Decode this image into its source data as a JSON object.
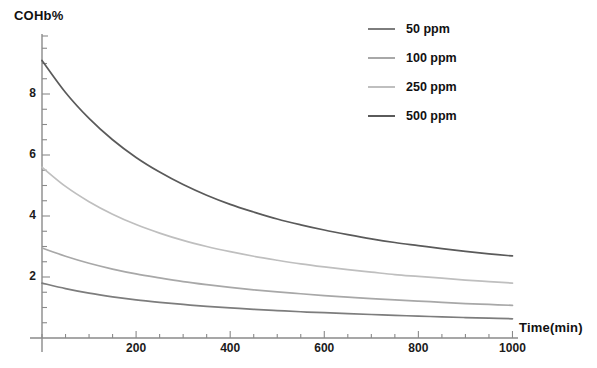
{
  "chart_data": {
    "type": "line",
    "title": "",
    "xlabel": "Time(min)",
    "ylabel": "COHb%",
    "xlim": [
      0,
      1050
    ],
    "ylim": [
      0,
      9.6
    ],
    "grid": false,
    "legend_position": "top-right",
    "xticks": [
      200,
      400,
      600,
      800,
      1000
    ],
    "xtick_labels": [
      "200",
      "400",
      "600",
      "800",
      "1000"
    ],
    "xminor_step": 50,
    "yticks": [
      2,
      4,
      6,
      8
    ],
    "ytick_labels": [
      "2",
      "4",
      "6",
      "8"
    ],
    "yminor_step": 0.5,
    "x": [
      0,
      50,
      100,
      150,
      200,
      250,
      300,
      350,
      400,
      450,
      500,
      550,
      600,
      650,
      700,
      750,
      800,
      850,
      900,
      950,
      1000
    ],
    "series": [
      {
        "name": "50 ppm",
        "color": "#7d7d7d",
        "values": [
          1.8,
          1.62,
          1.47,
          1.35,
          1.25,
          1.17,
          1.1,
          1.04,
          0.99,
          0.94,
          0.9,
          0.86,
          0.83,
          0.8,
          0.77,
          0.74,
          0.72,
          0.69,
          0.67,
          0.65,
          0.63
        ]
      },
      {
        "name": "100 ppm",
        "color": "#a8a8a8",
        "values": [
          2.95,
          2.68,
          2.45,
          2.26,
          2.1,
          1.97,
          1.85,
          1.75,
          1.66,
          1.58,
          1.51,
          1.45,
          1.39,
          1.34,
          1.29,
          1.25,
          1.21,
          1.17,
          1.13,
          1.1,
          1.07
        ]
      },
      {
        "name": "250 ppm",
        "color": "#bfbfbf",
        "values": [
          5.6,
          4.97,
          4.47,
          4.06,
          3.72,
          3.44,
          3.2,
          3.0,
          2.83,
          2.68,
          2.55,
          2.43,
          2.33,
          2.24,
          2.16,
          2.08,
          2.02,
          1.96,
          1.9,
          1.85,
          1.8
        ]
      },
      {
        "name": "500 ppm",
        "color": "#5a5a5a",
        "values": [
          9.1,
          8.05,
          7.2,
          6.5,
          5.92,
          5.44,
          5.03,
          4.68,
          4.38,
          4.13,
          3.9,
          3.71,
          3.54,
          3.39,
          3.25,
          3.13,
          3.03,
          2.93,
          2.84,
          2.76,
          2.69
        ]
      }
    ],
    "axis_color": "#8a8a8a"
  },
  "legend": {
    "items": [
      {
        "label": "50 ppm"
      },
      {
        "label": "100 ppm"
      },
      {
        "label": "250 ppm"
      },
      {
        "label": "500 ppm"
      }
    ]
  }
}
